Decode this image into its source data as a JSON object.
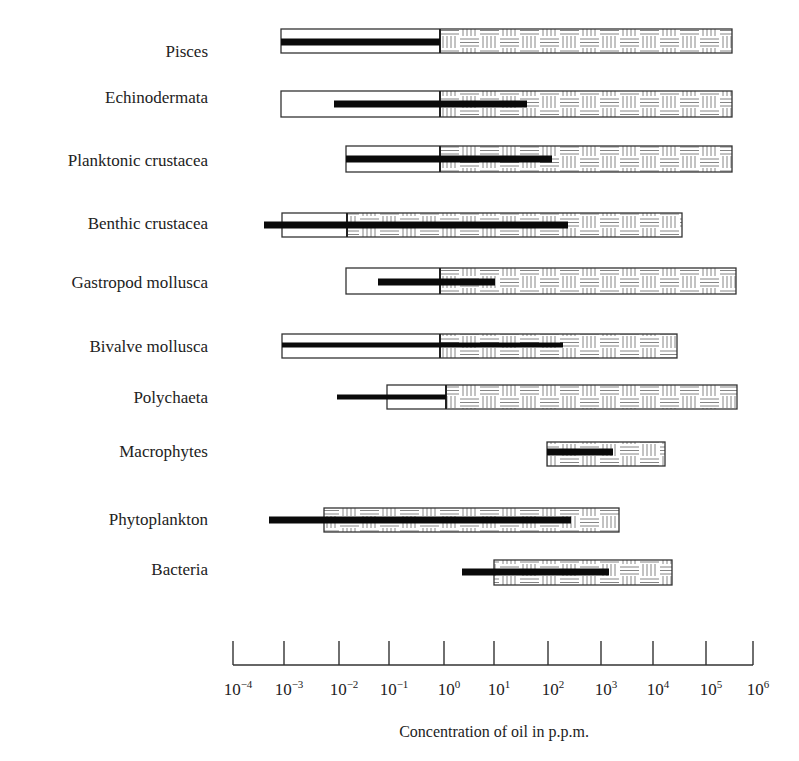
{
  "chart_data": {
    "type": "bar",
    "subtype": "horizontal range bars (log scale)",
    "title": "",
    "xlabel": "Concentration of oil in p.p.m.",
    "ylabel": "",
    "x_scale": "log10",
    "xlim_log10": [
      -4,
      6
    ],
    "x_ticks": [
      {
        "base": "10",
        "exp": "−4",
        "log": -4
      },
      {
        "base": "10",
        "exp": "−3",
        "log": -3
      },
      {
        "base": "10",
        "exp": "−2",
        "log": -2
      },
      {
        "base": "10",
        "exp": "−1",
        "log": -1
      },
      {
        "base": "10",
        "exp": "0",
        "log": 0
      },
      {
        "base": "10",
        "exp": "1",
        "log": 1
      },
      {
        "base": "10",
        "exp": "2",
        "log": 2
      },
      {
        "base": "10",
        "exp": "3",
        "log": 3
      },
      {
        "base": "10",
        "exp": "4",
        "log": 4
      },
      {
        "base": "10",
        "exp": "5",
        "log": 5
      },
      {
        "base": "10",
        "exp": "6",
        "log": 6
      }
    ],
    "grid": false,
    "legend": null,
    "encoding": {
      "outline_box": "overall tested concentration range (white = sublethal/no effect portion, hatched = lethal/toxic portion)",
      "black_bar": "observed effect range"
    },
    "categories": [
      "Pisces",
      "Echinodermata",
      "Planktonic crustacea",
      "Benthic crustacea",
      "Gastropod mollusca",
      "Bivalve mollusca",
      "Polychaeta",
      "Macrophytes",
      "Phytoplankton",
      "Bacteria"
    ],
    "series": [
      {
        "name": "range_box",
        "values_log10": [
          {
            "start": -3.0,
            "hatch_start": 0.0,
            "end": 5.8
          },
          {
            "start": -3.0,
            "hatch_start": 0.0,
            "end": 5.8
          },
          {
            "start": -1.8,
            "hatch_start": 0.0,
            "end": 5.8
          },
          {
            "start": -3.0,
            "hatch_start": -1.8,
            "end": 4.8
          },
          {
            "start": -1.8,
            "hatch_start": 0.0,
            "end": 5.9
          },
          {
            "start": -3.0,
            "hatch_start": 0.0,
            "end": 4.7
          },
          {
            "start": -1.1,
            "hatch_start": 0.0,
            "end": 5.9
          },
          {
            "start": 2.0,
            "hatch_start": 2.0,
            "end": 4.2
          },
          {
            "start": -2.3,
            "hatch_start": -2.3,
            "end": 3.3
          },
          {
            "start": 1.0,
            "hatch_start": 1.0,
            "end": 4.3
          }
        ]
      },
      {
        "name": "effect_bar",
        "values_log10": [
          {
            "start": -3.0,
            "end": 0.0,
            "weight": "thick"
          },
          {
            "start": -2.0,
            "end": 1.6,
            "weight": "thick"
          },
          {
            "start": -1.8,
            "end": 2.0,
            "weight": "thick"
          },
          {
            "start": -3.4,
            "end": 2.3,
            "weight": "thick"
          },
          {
            "start": -1.2,
            "end": 1.0,
            "weight": "thick"
          },
          {
            "start": -3.0,
            "end": 2.3,
            "weight": "thin"
          },
          {
            "start": -2.0,
            "end": 0.0,
            "weight": "thin"
          },
          {
            "start": 2.0,
            "end": 3.2,
            "weight": "thick"
          },
          {
            "start": -3.3,
            "end": 2.3,
            "weight": "thick"
          },
          {
            "start": 0.4,
            "end": 3.1,
            "weight": "thick"
          }
        ]
      }
    ]
  },
  "layout": {
    "rows_px": [
      {
        "label_y": 51,
        "box": [
          281,
          29,
          732,
          53
        ],
        "bar": [
          281,
          440,
          42
        ],
        "divider": 440
      },
      {
        "label_y": 97,
        "box": [
          281,
          91,
          732,
          117
        ],
        "bar": [
          334,
          527,
          104
        ],
        "divider": 440
      },
      {
        "label_y": 160,
        "box": [
          346,
          146,
          732,
          172
        ],
        "bar": [
          346,
          552,
          159
        ],
        "divider": 440
      },
      {
        "label_y": 223,
        "box": [
          282,
          213,
          682,
          237
        ],
        "bar": [
          264,
          568,
          225
        ],
        "divider": 347
      },
      {
        "label_y": 282,
        "box": [
          346,
          268,
          736,
          294
        ],
        "bar": [
          378,
          495,
          282
        ],
        "divider": 440
      },
      {
        "label_y": 346,
        "box": [
          282,
          334,
          677,
          358
        ],
        "bar": [
          282,
          563,
          345
        ],
        "divider": 440
      },
      {
        "label_y": 397,
        "box": [
          387,
          385,
          737,
          409
        ],
        "bar": [
          337,
          446,
          397
        ],
        "divider": 446
      },
      {
        "label_y": 451,
        "box": [
          547,
          442,
          665,
          466
        ],
        "bar": [
          547,
          613,
          452
        ],
        "divider": 547
      },
      {
        "label_y": 519,
        "box": [
          324,
          508,
          619,
          532
        ],
        "bar": [
          269,
          571,
          520
        ],
        "divider": 324
      },
      {
        "label_y": 569,
        "box": [
          494,
          560,
          672,
          585
        ],
        "bar": [
          462,
          609,
          572
        ],
        "divider": 494
      }
    ],
    "axis": {
      "x0": 233,
      "x1": 753,
      "baseline_y": 665,
      "tick_top": 641,
      "label_y": 695,
      "title_y": 737,
      "tick_x": [
        233,
        284,
        339,
        389,
        444,
        494,
        548,
        601,
        653,
        706,
        753
      ]
    }
  }
}
